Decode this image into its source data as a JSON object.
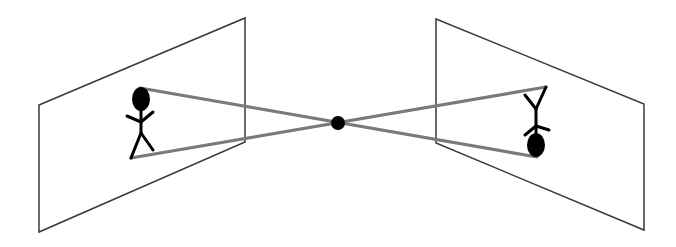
{
  "diagram": {
    "type": "pinhole-camera-projection",
    "elements": [
      {
        "id": "object-plane",
        "label": "",
        "description": "Left plane with upright stick figure (object)"
      },
      {
        "id": "pinhole",
        "label": "",
        "description": "Central aperture point where rays cross"
      },
      {
        "id": "image-plane",
        "label": "",
        "description": "Right plane with inverted stick figure (image)"
      }
    ],
    "object_orientation": "upright",
    "image_orientation": "inverted",
    "colors": {
      "plane_outline": "#3a3a3a",
      "ray": "#7a7a7a",
      "figure": "#000000",
      "pinhole": "#000000",
      "background": "#ffffff"
    }
  }
}
